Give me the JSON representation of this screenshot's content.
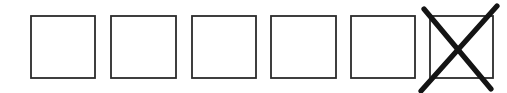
{
  "canvas": {
    "width": 507,
    "height": 93,
    "background_color": "#ffffff"
  },
  "figure": {
    "name": "row-of-checkboxes",
    "box_count": 6,
    "checked_count": 1,
    "box_style": {
      "stroke_color": "#2b2b2b",
      "stroke_width": 1.8,
      "fill_color": "#ffffff",
      "width": 64,
      "height": 62
    },
    "mark_style": {
      "stroke_color": "#141414",
      "stroke_width": 5.2,
      "glyph": "x-mark"
    },
    "boxes": [
      {
        "index": 1,
        "x": 31,
        "y": 16,
        "width": 64,
        "height": 62,
        "state": "unchecked",
        "mark": null
      },
      {
        "index": 2,
        "x": 111,
        "y": 16,
        "width": 65,
        "height": 62,
        "state": "unchecked",
        "mark": null
      },
      {
        "index": 3,
        "x": 192,
        "y": 16,
        "width": 64,
        "height": 62,
        "state": "unchecked",
        "mark": null
      },
      {
        "index": 4,
        "x": 271,
        "y": 16,
        "width": 65,
        "height": 62,
        "state": "unchecked",
        "mark": null
      },
      {
        "index": 5,
        "x": 351,
        "y": 16,
        "width": 64,
        "height": 62,
        "state": "unchecked",
        "mark": null
      },
      {
        "index": 6,
        "x": 430,
        "y": 16,
        "width": 63,
        "height": 62,
        "state": "checked",
        "mark": "x-mark"
      }
    ],
    "x_mark": {
      "stroke_a": {
        "x1": 424,
        "y1": 9,
        "x2": 491,
        "y2": 89
      },
      "stroke_b": {
        "x1": 497,
        "y1": 6,
        "x2": 421,
        "y2": 91
      },
      "crossing_point": {
        "x": 458,
        "y": 47
      }
    }
  }
}
